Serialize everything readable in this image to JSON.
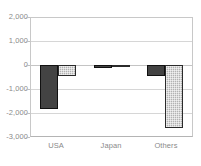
{
  "chart_data": {
    "type": "bar",
    "title": "",
    "subtitle": "",
    "xlabel": "",
    "ylabel": "",
    "categories": [
      "USA",
      "Japan",
      "Others"
    ],
    "series": [
      {
        "name": "Series 1",
        "values": [
          -1850,
          -110,
          -480
        ],
        "color": "#434343"
      },
      {
        "name": "Series 2",
        "values": [
          -480,
          -55,
          -2650
        ],
        "color": "#b2b2b2"
      }
    ],
    "ylim": [
      -3000,
      2000
    ],
    "yticks": [
      2000,
      1000,
      0,
      -1000,
      -2000,
      -3000
    ],
    "ytick_labels": [
      "2,000",
      "1,000",
      "0",
      "-1,000",
      "-2,000",
      "-3,000"
    ],
    "grid": true,
    "legend": "none",
    "orientation": "vertical",
    "bar_group_count": 3,
    "series_count": 2
  },
  "axis": {
    "y_labels": [
      "2,000",
      "1,000",
      "0",
      "-1,000",
      "-2,000",
      "-3,000"
    ],
    "x_labels": [
      "USA",
      "Japan",
      "Others"
    ]
  },
  "colors": {
    "series1": "#434343",
    "series2": "#b2b2b2",
    "grid": "#d6d6d6",
    "frame": "#c8c8c8",
    "tick_text": "#8a8a8a",
    "background": "#ffffff"
  }
}
